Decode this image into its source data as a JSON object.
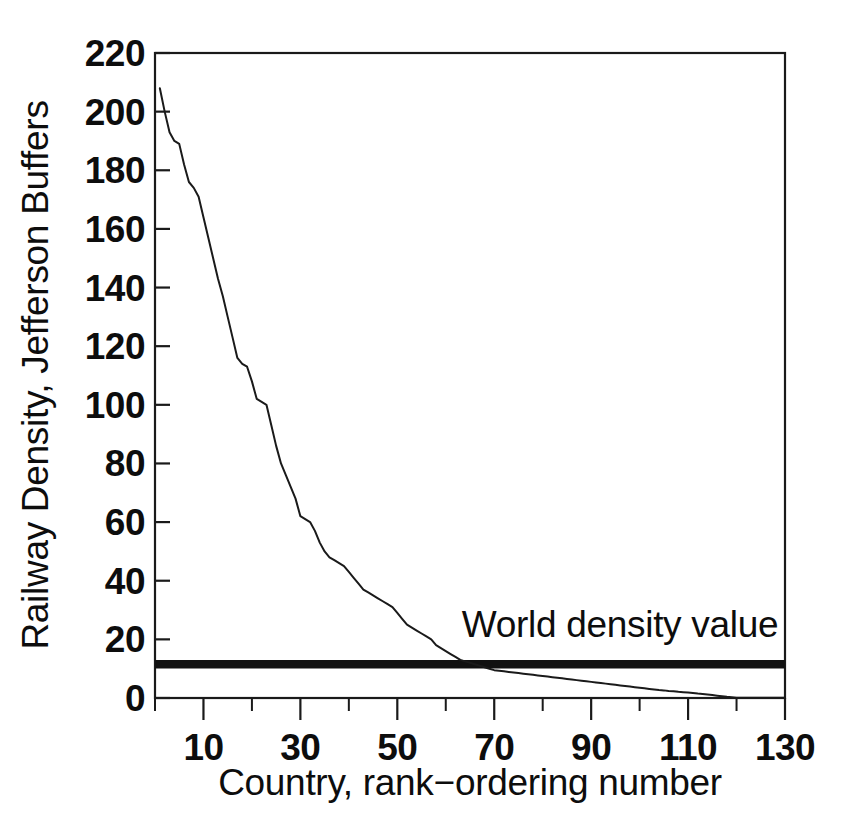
{
  "chart_data": {
    "type": "line",
    "title": "",
    "xlabel": "Country, rank−ordering number",
    "ylabel": "Railway Density, Jefferson Buffers",
    "xlim": [
      0,
      130
    ],
    "ylim": [
      0,
      220
    ],
    "grid": false,
    "legend_position": "none",
    "x_ticks": [
      0,
      10,
      20,
      30,
      40,
      50,
      60,
      70,
      80,
      90,
      100,
      110,
      120,
      130
    ],
    "x_tick_labels": [
      "",
      "10",
      "",
      "30",
      "",
      "50",
      "",
      "70",
      "",
      "90",
      "",
      "110",
      "",
      "130"
    ],
    "y_ticks": [
      0,
      20,
      40,
      60,
      80,
      100,
      120,
      140,
      160,
      180,
      200,
      220
    ],
    "y_tick_labels": [
      "0",
      "20",
      "40",
      "60",
      "80",
      "100",
      "120",
      "140",
      "160",
      "180",
      "200",
      "220"
    ],
    "series": [
      {
        "name": "Railway density by country rank",
        "x": [
          1,
          2,
          3,
          4,
          5,
          6,
          7,
          8,
          9,
          10,
          11,
          12,
          13,
          14,
          15,
          16,
          17,
          18,
          19,
          20,
          21,
          22,
          23,
          24,
          25,
          26,
          27,
          28,
          29,
          30,
          31,
          32,
          33,
          34,
          35,
          36,
          37,
          38,
          39,
          40,
          41,
          42,
          43,
          44,
          45,
          46,
          47,
          48,
          49,
          50,
          51,
          52,
          53,
          54,
          55,
          56,
          57,
          58,
          59,
          60,
          61,
          62,
          63,
          64,
          65,
          66,
          67,
          68,
          69,
          70,
          71,
          72,
          73,
          74,
          75,
          76,
          77,
          78,
          79,
          80,
          81,
          82,
          83,
          84,
          85,
          86,
          87,
          88,
          89,
          90,
          91,
          92,
          93,
          94,
          95,
          96,
          97,
          98,
          99,
          100,
          101,
          102,
          103,
          104,
          105,
          106,
          107,
          108,
          109,
          110,
          111,
          112,
          113,
          114,
          115,
          116,
          117,
          118,
          119,
          120,
          121,
          122,
          123,
          124,
          125,
          126,
          127,
          128,
          129,
          130
        ],
        "values": [
          208,
          200,
          193,
          190,
          189,
          182,
          176,
          174,
          171,
          164,
          157,
          150,
          143,
          137,
          130,
          123,
          116,
          114,
          113,
          108,
          102,
          101,
          100,
          93,
          86,
          80,
          76,
          72,
          68,
          62,
          61,
          60,
          57,
          53,
          50,
          48,
          47,
          46,
          45,
          43,
          41,
          39,
          37,
          36,
          35,
          34,
          33,
          32,
          31,
          29,
          27,
          25,
          24,
          23,
          22,
          21,
          20,
          18,
          17,
          16,
          15,
          14,
          13,
          12.5,
          12,
          11.5,
          11,
          10.5,
          10,
          9.5,
          9.3,
          9.1,
          8.9,
          8.7,
          8.5,
          8.3,
          8.1,
          7.9,
          7.7,
          7.5,
          7.3,
          7.1,
          6.9,
          6.7,
          6.5,
          6.3,
          6.1,
          5.9,
          5.7,
          5.5,
          5.3,
          5.1,
          4.9,
          4.7,
          4.5,
          4.3,
          4.1,
          3.9,
          3.7,
          3.5,
          3.3,
          3.1,
          2.9,
          2.7,
          2.6,
          2.4,
          2.3,
          2.1,
          2.0,
          1.9,
          1.7,
          1.5,
          1.4,
          1.2,
          1.0,
          0.8,
          0.6,
          0.4,
          0.25,
          0.1,
          0.05,
          0.05,
          0.05,
          0.05,
          0.05,
          0.05,
          0.05,
          0.05,
          0.05,
          0.05
        ]
      }
    ],
    "reference_line": {
      "label": "World density value",
      "value": 11.5,
      "x_start": 0,
      "x_end": 130,
      "color": "#111111"
    },
    "annotations": [
      {
        "text": "World density value",
        "x": 100,
        "y": 25
      }
    ]
  },
  "colors": {
    "background": "#ffffff",
    "ink": "#1a1a1a",
    "reference": "#111111"
  }
}
